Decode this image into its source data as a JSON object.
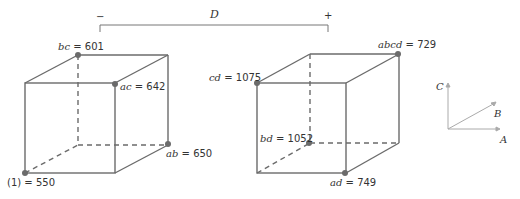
{
  "factor_bracket": {
    "label": "D",
    "minus": "−",
    "plus": "+"
  },
  "cube_minus": {
    "vertices": [
      {
        "label": "bc",
        "value": "601"
      },
      {
        "label": "ac",
        "value": "642"
      },
      {
        "label": "ab",
        "value": "650"
      },
      {
        "label": "(1)",
        "value": "550"
      }
    ]
  },
  "cube_plus": {
    "vertices": [
      {
        "label": "abcd",
        "value": "729"
      },
      {
        "label": "cd",
        "value": "1075"
      },
      {
        "label": "bd",
        "value": "1052"
      },
      {
        "label": "ad",
        "value": "749"
      }
    ]
  },
  "axes": {
    "a": "A",
    "b": "B",
    "c": "C"
  },
  "colors": {
    "line": "#6b6b6b",
    "dot": "#6b6b6b",
    "text": "#333333"
  }
}
